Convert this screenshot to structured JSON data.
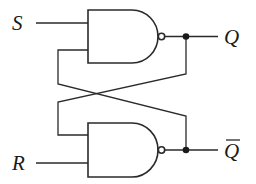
{
  "diagram": {
    "type": "SR latch (cross-coupled NAND gates)",
    "labels": {
      "input_s": "S",
      "input_r": "R",
      "output_q": "Q",
      "output_qbar": "Q"
    },
    "components": [
      {
        "id": "nand-top",
        "kind": "NAND gate",
        "inputs": [
          "S",
          "Q̄ feedback"
        ],
        "output": "Q"
      },
      {
        "id": "nand-bottom",
        "kind": "NAND gate",
        "inputs": [
          "Q feedback",
          "R"
        ],
        "output": "Q̄"
      }
    ],
    "colors": {
      "line": "#2a2a2a",
      "background": "#ffffff"
    }
  }
}
